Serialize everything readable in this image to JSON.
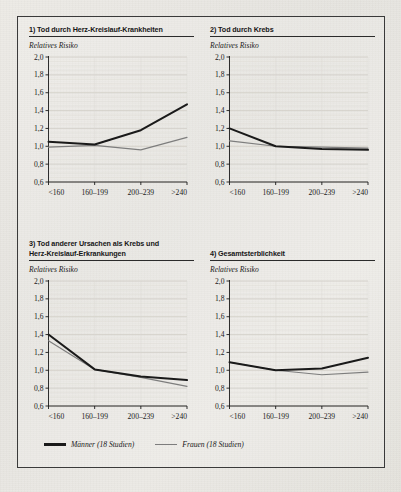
{
  "figure": {
    "background_color": "#e9e7e2",
    "frame_color": "#3a3a3a"
  },
  "series_colors": {
    "maenner": "#1a1a1a",
    "frauen": "#7d7d7d"
  },
  "legend": {
    "items": [
      {
        "label": "Männer (18 Studien)",
        "color": "#1a1a1a",
        "name": "maenner"
      },
      {
        "label": "Frauen (18 Studien)",
        "color": "#7d7d7d",
        "name": "frauen"
      }
    ]
  },
  "axis": {
    "ylabel": "Relatives Risiko",
    "yticks": [
      "2,0",
      "1,8",
      "1,6",
      "1,4",
      "1,2",
      "1,0",
      "0,8",
      "0,6"
    ],
    "xticks": [
      "<160",
      "160–199",
      "200–239",
      ">240"
    ]
  },
  "chart_data": [
    {
      "type": "line",
      "panel": "1",
      "title": "1) Tod durch Herz-Kreislauf-Krankheiten",
      "title_lines": [
        "1) Tod durch Herz-Kreislauf-Krankheiten"
      ],
      "xlabel": "",
      "ylabel": "Relatives Risiko",
      "categories": [
        "<160",
        "160–199",
        "200–239",
        ">240"
      ],
      "ylim": [
        0.6,
        2.0
      ],
      "yticks": [
        0.6,
        0.8,
        1.0,
        1.2,
        1.4,
        1.6,
        1.8,
        2.0
      ],
      "grid": true,
      "legend_position": "below-figure",
      "series": [
        {
          "name": "Männer (18 Studien)",
          "values": [
            1.05,
            1.02,
            1.18,
            1.47
          ]
        },
        {
          "name": "Frauen (18 Studien)",
          "values": [
            0.99,
            1.01,
            0.96,
            1.1
          ]
        }
      ]
    },
    {
      "type": "line",
      "panel": "2",
      "title": "2) Tod durch Krebs",
      "title_lines": [
        "2) Tod durch Krebs"
      ],
      "xlabel": "",
      "ylabel": "Relatives Risiko",
      "categories": [
        "<160",
        "160–199",
        "200–239",
        ">240"
      ],
      "ylim": [
        0.6,
        2.0
      ],
      "yticks": [
        0.6,
        0.8,
        1.0,
        1.2,
        1.4,
        1.6,
        1.8,
        2.0
      ],
      "grid": true,
      "legend_position": "below-figure",
      "series": [
        {
          "name": "Männer (18 Studien)",
          "values": [
            1.2,
            1.0,
            0.97,
            0.96
          ]
        },
        {
          "name": "Frauen (18 Studien)",
          "values": [
            1.06,
            1.0,
            0.99,
            0.98
          ]
        }
      ]
    },
    {
      "type": "line",
      "panel": "3",
      "title": "3) Tod anderer Ursachen als Krebs und Herz-Kreislauf-Erkrankungen",
      "title_lines": [
        "3) Tod anderer Ursachen als Krebs und",
        "Herz-Kreislauf-Erkrankungen"
      ],
      "xlabel": "",
      "ylabel": "Relatives Risiko",
      "categories": [
        "<160",
        "160–199",
        "200–239",
        ">240"
      ],
      "ylim": [
        0.6,
        2.0
      ],
      "yticks": [
        0.6,
        0.8,
        1.0,
        1.2,
        1.4,
        1.6,
        1.8,
        2.0
      ],
      "grid": true,
      "legend_position": "below-figure",
      "series": [
        {
          "name": "Männer (18 Studien)",
          "values": [
            1.4,
            1.01,
            0.93,
            0.89
          ]
        },
        {
          "name": "Frauen (18 Studien)",
          "values": [
            1.33,
            1.01,
            0.92,
            0.82
          ]
        }
      ]
    },
    {
      "type": "line",
      "panel": "4",
      "title": "4) Gesamtsterblichkeit",
      "title_lines": [
        "4) Gesamtsterblichkeit"
      ],
      "xlabel": "",
      "ylabel": "Relatives Risiko",
      "categories": [
        "<160",
        "160–199",
        "200–239",
        ">240"
      ],
      "ylim": [
        0.6,
        2.0
      ],
      "yticks": [
        0.6,
        0.8,
        1.0,
        1.2,
        1.4,
        1.6,
        1.8,
        2.0
      ],
      "grid": true,
      "legend_position": "below-figure",
      "series": [
        {
          "name": "Männer (18 Studien)",
          "values": [
            1.09,
            1.0,
            1.02,
            1.14
          ]
        },
        {
          "name": "Frauen (18 Studien)",
          "values": [
            1.09,
            1.0,
            0.95,
            0.98
          ]
        }
      ]
    }
  ]
}
